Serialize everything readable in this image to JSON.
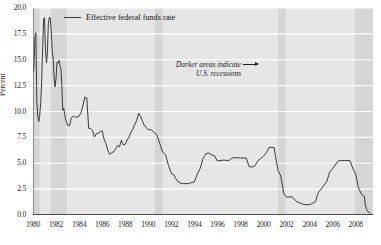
{
  "chart_data": {
    "type": "line",
    "title": "",
    "subtitle": "",
    "xlabel": "",
    "ylabel": "Percent",
    "xlim": [
      1980.0,
      2009.5
    ],
    "ylim": [
      0.0,
      20.0
    ],
    "grid": true,
    "grid_axis": "y",
    "legend_position": "top-left-inside",
    "legend_entries": [
      "Effective federal funds rate"
    ],
    "ytick_labels": [
      "0.0",
      "2.5",
      "5.0",
      "7.5",
      "10.0",
      "12.5",
      "15.0",
      "17.5",
      "20.0"
    ],
    "ytick_values": [
      0.0,
      2.5,
      5.0,
      7.5,
      10.0,
      12.5,
      15.0,
      17.5,
      20.0
    ],
    "xtick_labels": [
      "1980",
      "1982",
      "1984",
      "1986",
      "1988",
      "1990",
      "1992",
      "1994",
      "1996",
      "1998",
      "2000",
      "2002",
      "2004",
      "2006",
      "2008"
    ],
    "xtick_values": [
      1980,
      1982,
      1984,
      1986,
      1988,
      1990,
      1992,
      1994,
      1996,
      1998,
      2000,
      2002,
      2004,
      2006,
      2008
    ],
    "xminor_step": 1,
    "annotations": [
      {
        "text_line1": "Darker areas indicate",
        "text_line2": "U.S. recessions",
        "arrow": "right",
        "style": "italic"
      }
    ],
    "shaded_bands": {
      "label": "U.S. recessions",
      "color": "#d5d5d5",
      "ranges": [
        [
          1980.0,
          1980.58
        ],
        [
          1981.58,
          1982.92
        ],
        [
          1990.58,
          1991.25
        ],
        [
          2001.25,
          2001.92
        ],
        [
          2007.95,
          2009.5
        ]
      ]
    },
    "series": [
      {
        "name": "Effective federal funds rate",
        "color": "#3a3a3a",
        "x": [
          1980.0,
          1980.08,
          1980.17,
          1980.25,
          1980.33,
          1980.42,
          1980.5,
          1980.58,
          1980.67,
          1980.75,
          1980.83,
          1980.92,
          1981.0,
          1981.08,
          1981.17,
          1981.25,
          1981.33,
          1981.42,
          1981.5,
          1981.58,
          1981.67,
          1981.75,
          1981.83,
          1981.92,
          1982.0,
          1982.08,
          1982.17,
          1982.25,
          1982.33,
          1982.42,
          1982.5,
          1982.58,
          1982.67,
          1982.75,
          1982.83,
          1982.92,
          1983.0,
          1983.17,
          1983.33,
          1983.5,
          1983.67,
          1983.83,
          1984.0,
          1984.17,
          1984.33,
          1984.5,
          1984.67,
          1984.83,
          1985.0,
          1985.17,
          1985.33,
          1985.5,
          1985.67,
          1985.83,
          1986.0,
          1986.17,
          1986.33,
          1986.5,
          1986.67,
          1986.83,
          1987.0,
          1987.17,
          1987.33,
          1987.5,
          1987.67,
          1987.83,
          1988.0,
          1988.17,
          1988.33,
          1988.5,
          1988.67,
          1988.83,
          1989.0,
          1989.17,
          1989.33,
          1989.5,
          1989.67,
          1989.83,
          1990.0,
          1990.25,
          1990.5,
          1990.75,
          1991.0,
          1991.25,
          1991.5,
          1991.75,
          1992.0,
          1992.25,
          1992.5,
          1992.75,
          1993.0,
          1993.5,
          1994.0,
          1994.25,
          1994.5,
          1994.75,
          1995.0,
          1995.25,
          1995.5,
          1995.75,
          1996.0,
          1996.5,
          1997.0,
          1997.25,
          1997.5,
          1998.0,
          1998.5,
          1998.75,
          1999.0,
          1999.25,
          1999.5,
          1999.75,
          2000.0,
          2000.25,
          2000.5,
          2000.92,
          2001.0,
          2001.25,
          2001.5,
          2001.75,
          2001.92,
          2002.0,
          2002.5,
          2002.92,
          2003.0,
          2003.5,
          2003.75,
          2004.0,
          2004.5,
          2004.75,
          2005.0,
          2005.5,
          2005.75,
          2006.0,
          2006.5,
          2006.75,
          2007.0,
          2007.5,
          2007.75,
          2008.0,
          2008.17,
          2008.25,
          2008.5,
          2008.75,
          2008.83,
          2009.0,
          2009.25
        ],
        "y": [
          13.82,
          14.13,
          17.19,
          17.61,
          10.98,
          9.47,
          9.03,
          9.61,
          10.87,
          12.81,
          15.85,
          18.9,
          19.08,
          15.93,
          14.7,
          15.72,
          18.52,
          19.1,
          19.04,
          17.82,
          15.87,
          15.08,
          13.31,
          12.37,
          13.22,
          14.78,
          14.68,
          14.94,
          14.45,
          14.15,
          12.59,
          10.12,
          10.31,
          9.71,
          9.2,
          8.95,
          8.68,
          8.63,
          9.37,
          9.56,
          9.45,
          9.47,
          9.56,
          9.91,
          10.56,
          11.39,
          11.3,
          8.38,
          8.35,
          8.16,
          7.53,
          7.88,
          7.9,
          8.05,
          8.14,
          7.3,
          6.92,
          6.21,
          5.85,
          6.04,
          6.1,
          6.37,
          6.73,
          6.58,
          7.22,
          6.77,
          6.83,
          7.24,
          7.51,
          8.01,
          8.3,
          8.76,
          9.12,
          9.85,
          9.53,
          9.06,
          8.61,
          8.45,
          8.23,
          8.24,
          8.0,
          7.74,
          6.91,
          6.06,
          5.82,
          4.81,
          4.03,
          3.84,
          3.3,
          3.1,
          3.02,
          3.04,
          3.21,
          3.94,
          4.49,
          5.45,
          5.92,
          6.0,
          5.8,
          5.72,
          5.22,
          5.3,
          5.27,
          5.5,
          5.54,
          5.51,
          5.5,
          4.68,
          4.63,
          4.75,
          5.22,
          5.45,
          5.68,
          6.02,
          6.54,
          6.51,
          5.98,
          4.33,
          3.77,
          2.09,
          1.82,
          1.73,
          1.75,
          1.24,
          1.24,
          1.01,
          1.0,
          1.0,
          1.26,
          2.16,
          2.5,
          3.26,
          4.16,
          4.49,
          5.25,
          5.25,
          5.26,
          5.26,
          4.49,
          3.94,
          2.98,
          2.61,
          2.0,
          1.81,
          0.97,
          0.39,
          0.16
        ]
      }
    ]
  },
  "legend": {
    "entry_0": "Effective federal funds rate"
  },
  "annotation": {
    "line1": "Darker areas indicate",
    "line2": "U.S. recessions"
  },
  "axes": {
    "ylabel": "Percent"
  },
  "colors": {
    "line": "#3a3a3a",
    "plot_background": "#e6e6e6",
    "recession_band": "#d5d5d5",
    "gridline": "#ffffff",
    "axis": "#4a4a4a",
    "text": "#1b1b1b"
  }
}
